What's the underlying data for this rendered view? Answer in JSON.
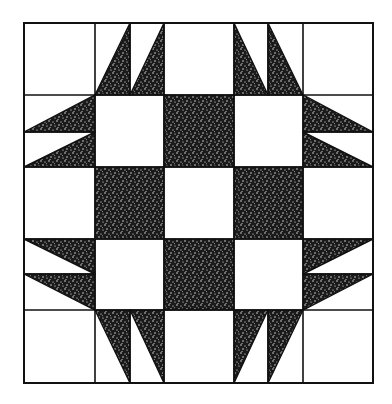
{
  "diagram": {
    "type": "quilt-block",
    "colors": {
      "background": "#ffffff",
      "line": "#111111",
      "fill_dark": "#1a1a1a",
      "fill_light": "#ffffff"
    },
    "grid": {
      "columns": 5,
      "rows": 5,
      "x_lines": [
        24,
        95,
        164,
        234,
        303,
        373
      ],
      "y_lines": [
        23,
        95,
        167,
        239,
        310,
        383
      ]
    },
    "shaded_squares": [
      {
        "col": 2,
        "row": 1
      },
      {
        "col": 1,
        "row": 2
      },
      {
        "col": 3,
        "row": 2
      },
      {
        "col": 2,
        "row": 3
      }
    ],
    "triangle_cells": [
      {
        "position": "top-left",
        "col": 1,
        "row": 0
      },
      {
        "position": "top-right",
        "col": 3,
        "row": 0
      },
      {
        "position": "left-top",
        "col": 0,
        "row": 1
      },
      {
        "position": "right-top",
        "col": 4,
        "row": 1
      },
      {
        "position": "left-bottom",
        "col": 0,
        "row": 3
      },
      {
        "position": "right-bottom",
        "col": 4,
        "row": 3
      },
      {
        "position": "bottom-left",
        "col": 1,
        "row": 4
      },
      {
        "position": "bottom-right",
        "col": 3,
        "row": 4
      }
    ]
  }
}
